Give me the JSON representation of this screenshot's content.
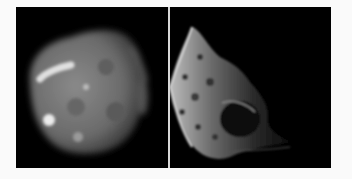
{
  "figure": {
    "panels": [
      {
        "id": "left",
        "subject": "blurry rounded moon, low-resolution grayscale",
        "background": "#000000",
        "body_color": "#7a7a7a",
        "highlight_color": "#e8e8e8"
      },
      {
        "id": "right",
        "subject": "cratered irregular moon, high-resolution grayscale, crescent lit from left",
        "background": "#000000",
        "body_color": "#5a5a5a",
        "highlight_color": "#d0d0d0"
      }
    ],
    "page_background": "#fafafa",
    "divider_color": "#d8d8d8"
  }
}
